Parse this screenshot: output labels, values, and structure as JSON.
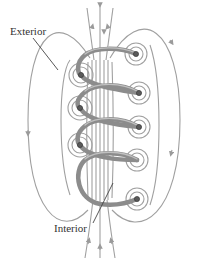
{
  "figure": {
    "labels": {
      "exterior": "Exterior",
      "interior": "Interior"
    },
    "colors": {
      "field_line": "#9a9a9a",
      "coil": "#8c8c8c",
      "coil_highlight": "#b5b5b5",
      "wire_end": "#555555",
      "label_text": "#333333",
      "leader_line": "#444444"
    },
    "coil_turns": 4
  }
}
